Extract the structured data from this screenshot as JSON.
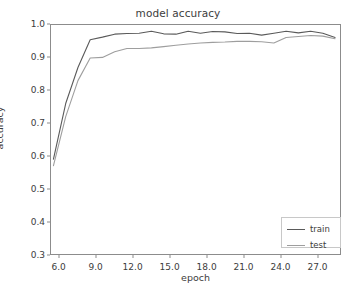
{
  "chart_data": {
    "type": "line",
    "title": "model accuracy",
    "xlabel": "epoch",
    "ylabel": "accuracy",
    "xlim": [
      5.3,
      28.9
    ],
    "ylim": [
      0.3,
      1.0
    ],
    "grid": false,
    "legend_position": "lower right",
    "xticks": [
      "6.0",
      "9.0",
      "12.0",
      "15.0",
      "18.0",
      "21.0",
      "24.0",
      "27.0"
    ],
    "xtick_values": [
      6.0,
      9.0,
      12.0,
      15.0,
      18.0,
      21.0,
      24.0,
      27.0
    ],
    "yticks": [
      "0.3",
      "0.4",
      "0.5",
      "0.6",
      "0.7",
      "0.8",
      "0.9",
      "1.0"
    ],
    "ytick_values": [
      0.3,
      0.4,
      0.5,
      0.6,
      0.7,
      0.8,
      0.9,
      1.0
    ],
    "x": [
      5.5,
      6.5,
      7.5,
      8.5,
      9.5,
      10.5,
      11.5,
      12.5,
      13.5,
      14.5,
      15.5,
      16.5,
      17.5,
      18.5,
      19.5,
      20.5,
      21.5,
      22.5,
      23.5,
      24.5,
      25.5,
      26.5,
      27.5,
      28.5
    ],
    "series": [
      {
        "name": "train",
        "color": "#5a5a5a",
        "values": [
          0.59,
          0.76,
          0.87,
          0.955,
          0.963,
          0.972,
          0.974,
          0.975,
          0.981,
          0.973,
          0.972,
          0.981,
          0.975,
          0.98,
          0.979,
          0.974,
          0.975,
          0.969,
          0.975,
          0.981,
          0.976,
          0.981,
          0.975,
          0.962
        ]
      },
      {
        "name": "test",
        "color": "#9e9e9e",
        "values": [
          0.57,
          0.72,
          0.83,
          0.899,
          0.901,
          0.918,
          0.928,
          0.928,
          0.93,
          0.934,
          0.938,
          0.942,
          0.945,
          0.947,
          0.948,
          0.95,
          0.95,
          0.949,
          0.945,
          0.962,
          0.965,
          0.968,
          0.966,
          0.958
        ]
      }
    ],
    "legend": [
      {
        "label": "train",
        "color": "#5a5a5a"
      },
      {
        "label": "test",
        "color": "#9e9e9e"
      }
    ]
  }
}
